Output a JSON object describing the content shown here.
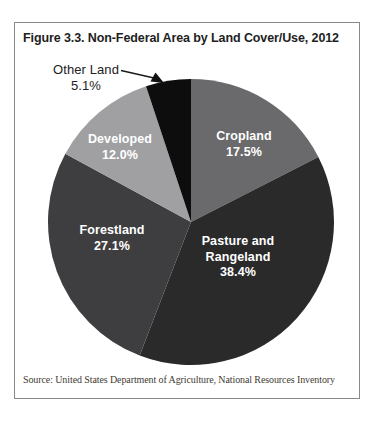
{
  "figure": {
    "title": "Figure 3.3. Non-Federal Area by Land Cover/Use, 2012",
    "source": "Source: United States Department of Agriculture, National Resources Inventory"
  },
  "chart_data": {
    "type": "pie",
    "title": "Figure 3.3. Non-Federal Area by Land Cover/Use, 2012",
    "start_angle_deg": 0,
    "direction": "clockwise",
    "legend_position": "labels-on-slices",
    "slices": [
      {
        "label": "Cropland",
        "value": 17.5,
        "pct_label": "17.5%",
        "color": "#6a6a6c",
        "label_style": "inside-white"
      },
      {
        "label": "Pasture and Rangeland",
        "value": 38.4,
        "pct_label": "38.4%",
        "color": "#2a2a2b",
        "label_style": "inside-white"
      },
      {
        "label": "Forestland",
        "value": 27.1,
        "pct_label": "27.1%",
        "color": "#3e3e40",
        "label_style": "inside-white"
      },
      {
        "label": "Developed",
        "value": 12.0,
        "pct_label": "12.0%",
        "color": "#a0a0a2",
        "label_style": "inside-white"
      },
      {
        "label": "Other Land",
        "value": 5.1,
        "pct_label": "5.1%",
        "color": "#0d0d0e",
        "label_style": "outside-dark-with-arrow"
      }
    ],
    "annotation_colors": {
      "leader_line": "#1a1a1a",
      "inside_label_text": "#ffffff",
      "outside_label_text": "#222222"
    }
  }
}
